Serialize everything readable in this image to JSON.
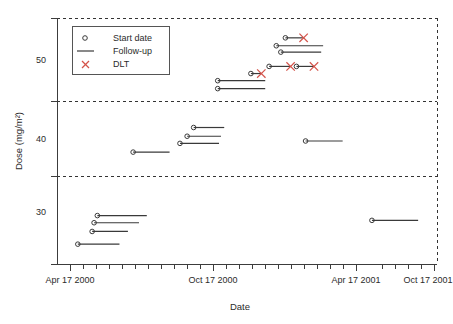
{
  "chart_data": {
    "type": "line",
    "title": "",
    "subtitle": "",
    "xlabel": "Date",
    "ylabel": "Dose (mg/m2)",
    "ylabel_display": "Dose (mg/m²)",
    "grid": true,
    "grid_style": "dashed horizontal dose-level boundaries",
    "legend_position": "top-left inside plot",
    "legend": [
      {
        "label": "Start date",
        "marker": "circle",
        "color": "#3a3a3a"
      },
      {
        "label": "Follow-up",
        "marker": "line",
        "color": "#3a3a3a"
      },
      {
        "label": "DLT",
        "marker": "cross",
        "color": "#d4534a"
      }
    ],
    "x_ticks": [
      "Apr 17 2000",
      "Oct 17 2000",
      "Apr 17 2001",
      "Oct 17 2001"
    ],
    "x_tick_values": [
      0,
      183,
      365,
      548
    ],
    "xlim": [
      -14,
      570
    ],
    "y_ticks": [
      30,
      40,
      50
    ],
    "ylim": [
      24.5,
      55.5
    ],
    "dose_band_boundaries": [
      35,
      45
    ],
    "series_note": "Each horizontal segment is one patient: circle = start date, line = follow-up duration, red cross = DLT event",
    "patients": [
      {
        "id": 1,
        "dose": 27.0,
        "start_day": 18,
        "end_day": 82,
        "dlt": false
      },
      {
        "id": 2,
        "dose": 28.6,
        "start_day": 40,
        "end_day": 95,
        "dlt": false
      },
      {
        "id": 3,
        "dose": 29.7,
        "start_day": 43,
        "end_day": 112,
        "dlt": false
      },
      {
        "id": 4,
        "dose": 30.6,
        "start_day": 48,
        "end_day": 124,
        "dlt": false
      },
      {
        "id": 5,
        "dose": 38.6,
        "start_day": 103,
        "end_day": 159,
        "dlt": false
      },
      {
        "id": 6,
        "dose": 39.7,
        "start_day": 175,
        "end_day": 235,
        "dlt": false
      },
      {
        "id": 7,
        "dose": 40.6,
        "start_day": 186,
        "end_day": 238,
        "dlt": false
      },
      {
        "id": 8,
        "dose": 41.7,
        "start_day": 196,
        "end_day": 243,
        "dlt": false
      },
      {
        "id": 9,
        "dose": 40.0,
        "start_day": 368,
        "end_day": 425,
        "dlt": false
      },
      {
        "id": 10,
        "dose": 30.0,
        "start_day": 470,
        "end_day": 541,
        "dlt": false
      },
      {
        "id": 11,
        "dose": 47.6,
        "start_day": 233,
        "end_day": 306,
        "dlt": false
      },
      {
        "id": 12,
        "dose": 46.6,
        "start_day": 233,
        "end_day": 306,
        "dlt": false
      },
      {
        "id": 13,
        "dose": 48.5,
        "start_day": 284,
        "end_day": 300,
        "dlt": true,
        "dlt_day": 300
      },
      {
        "id": 14,
        "dose": 49.4,
        "start_day": 312,
        "end_day": 345,
        "dlt": true,
        "dlt_day": 345
      },
      {
        "id": 15,
        "dose": 49.4,
        "start_day": 354,
        "end_day": 381,
        "dlt": true,
        "dlt_day": 381
      },
      {
        "id": 16,
        "dose": 51.2,
        "start_day": 330,
        "end_day": 392,
        "dlt": false
      },
      {
        "id": 17,
        "dose": 52.0,
        "start_day": 323,
        "end_day": 395,
        "dlt": false
      },
      {
        "id": 18,
        "dose": 53.0,
        "start_day": 337,
        "end_day": 365,
        "dlt": true,
        "dlt_day": 365
      }
    ]
  },
  "axes": {
    "y_title": "Dose (mg/m²)",
    "x_title": "Date",
    "y_tick_labels": [
      "50",
      "40",
      "30"
    ],
    "x_tick_labels": [
      "Apr 17 2000",
      "Oct 17 2000",
      "Apr 17 2001",
      "Oct 17 2001"
    ]
  },
  "legend": {
    "items": [
      "Start date",
      "Follow-up",
      "DLT"
    ]
  }
}
